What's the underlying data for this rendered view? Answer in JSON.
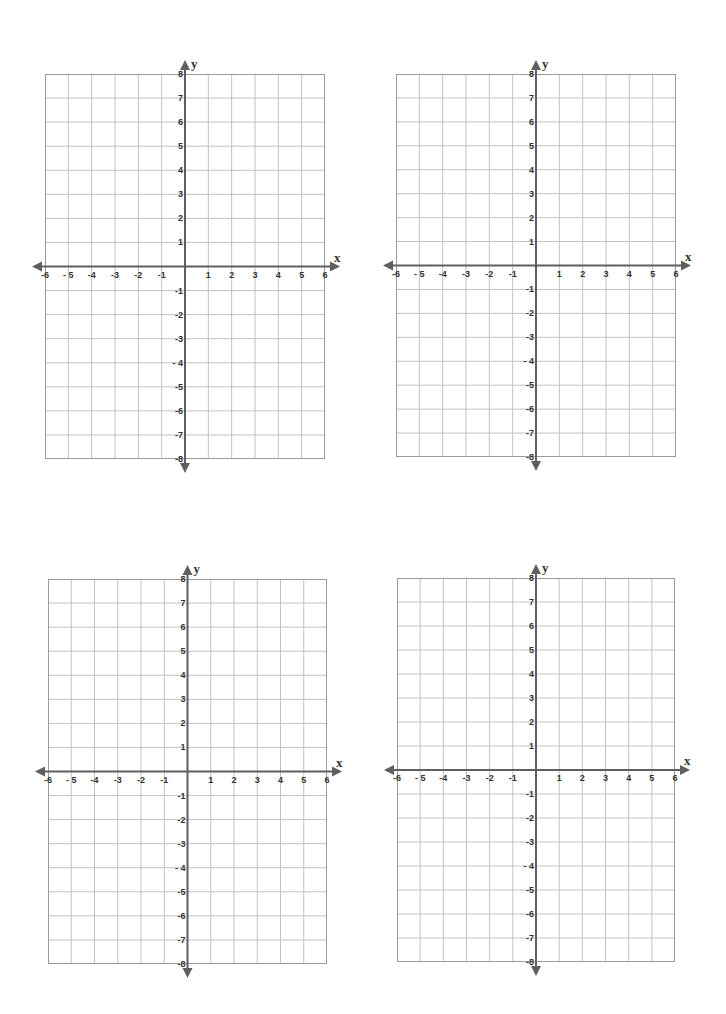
{
  "page": {
    "background": "#ffffff"
  },
  "style": {
    "grid_line_color": "#c2c2c2",
    "border_color": "#9a9a9a",
    "axis_color": "#5f5f5f",
    "label_color": "#333333"
  },
  "axes": {
    "x_name": "x",
    "y_name": "y",
    "x_min": -6,
    "x_max": 6,
    "y_min": -8,
    "y_max": 8,
    "x_tick_labels": [
      "-6",
      "- 5",
      "-4",
      "-3",
      "-2",
      "-1",
      "1",
      "2",
      "3",
      "4",
      "5",
      "6"
    ],
    "y_tick_labels": [
      "8",
      "7",
      "6",
      "5",
      "4",
      "3",
      "2",
      "1",
      "-1",
      "-2",
      "-3",
      "- 4",
      "-5",
      "-6",
      "-7",
      "-8"
    ]
  },
  "planes": [
    {
      "id": "top-left",
      "left": 45,
      "top": 74,
      "right": 325,
      "bottom": 459
    },
    {
      "id": "top-right",
      "left": 396,
      "top": 74,
      "right": 676,
      "bottom": 457
    },
    {
      "id": "bottom-left",
      "left": 48,
      "top": 579,
      "right": 327,
      "bottom": 964
    },
    {
      "id": "bottom-right",
      "left": 397,
      "top": 578,
      "right": 675,
      "bottom": 962
    }
  ],
  "chart_data": [
    {
      "type": "scatter",
      "title": "",
      "xlabel": "x",
      "ylabel": "y",
      "xlim": [
        -6,
        6
      ],
      "ylim": [
        -8,
        8
      ],
      "x_ticks": [
        -6,
        -5,
        -4,
        -3,
        -2,
        -1,
        1,
        2,
        3,
        4,
        5,
        6
      ],
      "y_ticks": [
        -8,
        -7,
        -6,
        -5,
        -4,
        -3,
        -2,
        -1,
        1,
        2,
        3,
        4,
        5,
        6,
        7,
        8
      ],
      "grid": true,
      "series": []
    },
    {
      "type": "scatter",
      "title": "",
      "xlabel": "x",
      "ylabel": "y",
      "xlim": [
        -6,
        6
      ],
      "ylim": [
        -8,
        8
      ],
      "x_ticks": [
        -6,
        -5,
        -4,
        -3,
        -2,
        -1,
        1,
        2,
        3,
        4,
        5,
        6
      ],
      "y_ticks": [
        -8,
        -7,
        -6,
        -5,
        -4,
        -3,
        -2,
        -1,
        1,
        2,
        3,
        4,
        5,
        6,
        7,
        8
      ],
      "grid": true,
      "series": []
    },
    {
      "type": "scatter",
      "title": "",
      "xlabel": "x",
      "ylabel": "y",
      "xlim": [
        -6,
        6
      ],
      "ylim": [
        -8,
        8
      ],
      "x_ticks": [
        -6,
        -5,
        -4,
        -3,
        -2,
        -1,
        1,
        2,
        3,
        4,
        5,
        6
      ],
      "y_ticks": [
        -8,
        -7,
        -6,
        -5,
        -4,
        -3,
        -2,
        -1,
        1,
        2,
        3,
        4,
        5,
        6,
        7,
        8
      ],
      "grid": true,
      "series": []
    },
    {
      "type": "scatter",
      "title": "",
      "xlabel": "x",
      "ylabel": "y",
      "xlim": [
        -6,
        6
      ],
      "ylim": [
        -8,
        8
      ],
      "x_ticks": [
        -6,
        -5,
        -4,
        -3,
        -2,
        -1,
        1,
        2,
        3,
        4,
        5,
        6
      ],
      "y_ticks": [
        -8,
        -7,
        -6,
        -5,
        -4,
        -3,
        -2,
        -1,
        1,
        2,
        3,
        4,
        5,
        6,
        7,
        8
      ],
      "grid": true,
      "series": []
    }
  ]
}
